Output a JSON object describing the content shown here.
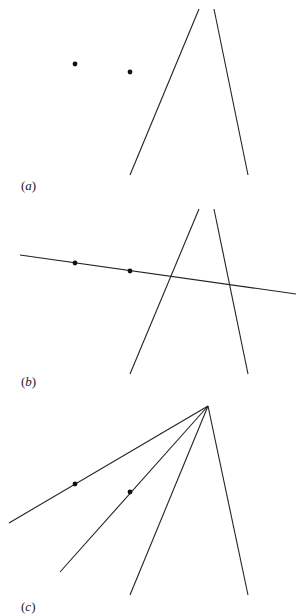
{
  "figure": {
    "panels": [
      {
        "id": "a",
        "label_open": "(",
        "label_letter": "a",
        "label_close": ")",
        "description": "Two points and two lines"
      },
      {
        "id": "b",
        "label_open": "(",
        "label_letter": "b",
        "label_close": ")",
        "description": "Line through the two points crossing the two lines"
      },
      {
        "id": "c",
        "label_open": "(",
        "label_letter": "c",
        "label_close": ")",
        "description": "Four concurrent lines, two passing through the points"
      }
    ],
    "colors": {
      "line": "#222222",
      "point": "#111111",
      "background": "#ffffff"
    }
  }
}
